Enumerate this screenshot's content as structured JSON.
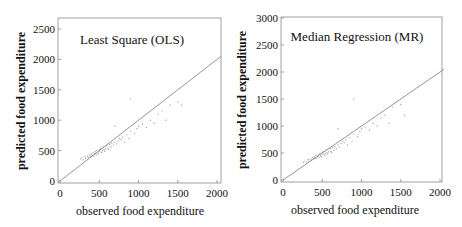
{
  "chart_data": [
    {
      "type": "scatter",
      "title": "Least Square (OLS)",
      "xlabel": "observed food expenditure",
      "ylabel": "predicted food expenditure",
      "xlim": [
        0,
        2050
      ],
      "ylim": [
        0,
        2650
      ],
      "xticks": [
        0,
        500,
        1000,
        1500,
        2000
      ],
      "yticks": [
        0,
        500,
        1000,
        1500,
        2000,
        2500
      ],
      "reference_line": {
        "label": "y = x",
        "from": [
          0,
          0
        ],
        "to": [
          2050,
          2050
        ]
      },
      "grid": false,
      "series": [
        {
          "name": "observations",
          "points": [
            [
              260,
              360
            ],
            [
              280,
              380
            ],
            [
              300,
              350
            ],
            [
              320,
              400
            ],
            [
              330,
              370
            ],
            [
              350,
              410
            ],
            [
              360,
              390
            ],
            [
              380,
              430
            ],
            [
              390,
              400
            ],
            [
              400,
              440
            ],
            [
              410,
              420
            ],
            [
              420,
              470
            ],
            [
              430,
              410
            ],
            [
              440,
              450
            ],
            [
              450,
              480
            ],
            [
              460,
              430
            ],
            [
              470,
              500
            ],
            [
              480,
              460
            ],
            [
              490,
              440
            ],
            [
              500,
              520
            ],
            [
              510,
              480
            ],
            [
              520,
              540
            ],
            [
              530,
              470
            ],
            [
              540,
              500
            ],
            [
              550,
              560
            ],
            [
              560,
              510
            ],
            [
              570,
              490
            ],
            [
              580,
              530
            ],
            [
              600,
              580
            ],
            [
              610,
              540
            ],
            [
              620,
              520
            ],
            [
              630,
              600
            ],
            [
              650,
              560
            ],
            [
              660,
              620
            ],
            [
              680,
              590
            ],
            [
              700,
              640
            ],
            [
              720,
              610
            ],
            [
              740,
              660
            ],
            [
              760,
              700
            ],
            [
              780,
              680
            ],
            [
              800,
              720
            ],
            [
              820,
              640
            ],
            [
              850,
              760
            ],
            [
              880,
              700
            ],
            [
              900,
              820
            ],
            [
              950,
              780
            ],
            [
              980,
              860
            ],
            [
              1000,
              900
            ],
            [
              1050,
              940
            ],
            [
              1100,
              880
            ],
            [
              1150,
              1000
            ],
            [
              1200,
              950
            ],
            [
              1250,
              1100
            ],
            [
              1300,
              1150
            ],
            [
              1350,
              1000
            ],
            [
              1400,
              1250
            ],
            [
              1500,
              1300
            ],
            [
              1550,
              1250
            ],
            [
              900,
              1350
            ],
            [
              700,
              900
            ]
          ]
        }
      ]
    },
    {
      "type": "scatter",
      "title": "Median Regression (MR)",
      "xlabel": "observed food expenditure",
      "ylabel": "predicted food expenditure",
      "xlim": [
        0,
        2050
      ],
      "ylim": [
        0,
        3000
      ],
      "xticks": [
        0,
        500,
        1000,
        1500,
        2000
      ],
      "yticks": [
        0,
        500,
        1000,
        1500,
        2000,
        2500,
        3000
      ],
      "reference_line": {
        "label": "y = x",
        "from": [
          0,
          0
        ],
        "to": [
          2050,
          2050
        ]
      },
      "grid": false,
      "series": [
        {
          "name": "observations",
          "points": [
            [
              260,
              330
            ],
            [
              280,
              350
            ],
            [
              300,
              320
            ],
            [
              320,
              380
            ],
            [
              330,
              350
            ],
            [
              350,
              390
            ],
            [
              360,
              370
            ],
            [
              380,
              420
            ],
            [
              390,
              390
            ],
            [
              400,
              430
            ],
            [
              410,
              400
            ],
            [
              420,
              460
            ],
            [
              430,
              400
            ],
            [
              440,
              440
            ],
            [
              450,
              470
            ],
            [
              460,
              420
            ],
            [
              470,
              490
            ],
            [
              480,
              450
            ],
            [
              490,
              430
            ],
            [
              500,
              510
            ],
            [
              510,
              470
            ],
            [
              520,
              530
            ],
            [
              530,
              460
            ],
            [
              540,
              490
            ],
            [
              550,
              560
            ],
            [
              560,
              500
            ],
            [
              570,
              480
            ],
            [
              580,
              520
            ],
            [
              600,
              580
            ],
            [
              610,
              530
            ],
            [
              620,
              510
            ],
            [
              630,
              600
            ],
            [
              650,
              550
            ],
            [
              660,
              620
            ],
            [
              680,
              580
            ],
            [
              700,
              650
            ],
            [
              720,
              610
            ],
            [
              740,
              680
            ],
            [
              760,
              720
            ],
            [
              780,
              690
            ],
            [
              800,
              740
            ],
            [
              820,
              650
            ],
            [
              850,
              780
            ],
            [
              880,
              720
            ],
            [
              900,
              850
            ],
            [
              950,
              800
            ],
            [
              980,
              900
            ],
            [
              1000,
              950
            ],
            [
              1050,
              980
            ],
            [
              1100,
              920
            ],
            [
              1150,
              1050
            ],
            [
              1200,
              1000
            ],
            [
              1250,
              1150
            ],
            [
              1300,
              1200
            ],
            [
              1350,
              1050
            ],
            [
              1400,
              1350
            ],
            [
              1500,
              1400
            ],
            [
              1550,
              1200
            ],
            [
              900,
              1500
            ],
            [
              700,
              950
            ]
          ]
        }
      ]
    }
  ],
  "panels": [
    {
      "title": "Least Square (OLS)",
      "xlabel": "observed food expenditure",
      "ylabel": "predicted  food  expenditure",
      "xtick_labels": [
        "0",
        "500",
        "1000",
        "1500",
        "2000"
      ],
      "ytick_labels": [
        "0",
        "500",
        "1000",
        "1500",
        "2000",
        "2500"
      ]
    },
    {
      "title": "Median Regression (MR)",
      "xlabel": "observed food expenditure",
      "ylabel": "predicted food expenditure",
      "xtick_labels": [
        "0",
        "500",
        "1000",
        "1500",
        "2000"
      ],
      "ytick_labels": [
        "0",
        "500",
        "1000",
        "1500",
        "2000",
        "2500",
        "3000"
      ]
    }
  ],
  "colors": {
    "frame": "#8a8a8a",
    "line": "#7a7a7a",
    "points": "#a8a8a8",
    "text": "#111111"
  }
}
